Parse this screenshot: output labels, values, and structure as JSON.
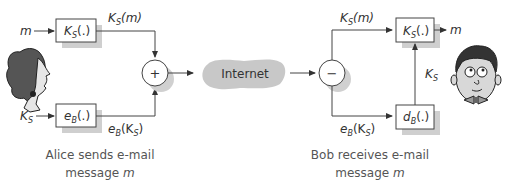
{
  "diagram": {
    "sender": {
      "name": "Alice",
      "input_message": "m",
      "input_key": "K",
      "input_key_sub": "S",
      "box_symmetric": {
        "main": "K",
        "sub": "S",
        "suffix": "(.)"
      },
      "box_encrypt": {
        "main": "e",
        "sub": "B",
        "suffix": "(.)"
      },
      "output_top": {
        "main": "K",
        "sub": "S",
        "suffix": "(m)"
      },
      "output_bottom": {
        "main": "e",
        "sub": "B",
        "mid": "(K",
        "sub2": "S",
        "end": ")"
      },
      "combiner": "+",
      "caption_line1": "Alice sends e-mail",
      "caption_line2_prefix": "message ",
      "caption_line2_var": "m"
    },
    "network": {
      "label": "Internet"
    },
    "receiver": {
      "name": "Bob",
      "splitter": "−",
      "input_top": {
        "main": "K",
        "sub": "S",
        "suffix": "(m)"
      },
      "input_bottom": {
        "main": "e",
        "sub": "B",
        "mid": "(K",
        "sub2": "S",
        "end": ")"
      },
      "box_symmetric": {
        "main": "K",
        "sub": "S",
        "suffix": "(.)"
      },
      "box_decrypt": {
        "main": "d",
        "sub": "B",
        "suffix": "(.)"
      },
      "key_label": {
        "main": "K",
        "sub": "S"
      },
      "output_message": "m",
      "caption_line1": "Bob receives e-mail",
      "caption_line2_prefix": "message ",
      "caption_line2_var": "m"
    },
    "colors": {
      "line": "#444444",
      "shadow": "#cccccc",
      "cloud": "#c8c8c8",
      "text": "#333333"
    }
  }
}
